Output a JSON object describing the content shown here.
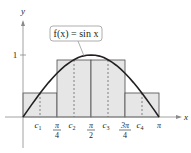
{
  "diagram": {
    "type": "midpoint-riemann-sum",
    "function_label": "f(x) = sin x",
    "axis": {
      "x_label": "x",
      "y_label": "y",
      "y_tick_label": "1"
    },
    "x_ticks": [
      {
        "num": "π",
        "den": "4"
      },
      {
        "num": "π",
        "den": "2"
      },
      {
        "num": "3π",
        "den": "4"
      },
      {
        "num": "π",
        "den": ""
      }
    ],
    "midpoints": [
      "c",
      "c",
      "c",
      "c"
    ],
    "midpoint_subscripts": [
      "1",
      "2",
      "3",
      "4"
    ],
    "rectangles": [
      {
        "x_start": 0,
        "x_end": 0.7854,
        "height": 0.383
      },
      {
        "x_start": 0.7854,
        "x_end": 1.5708,
        "height": 0.924
      },
      {
        "x_start": 1.5708,
        "x_end": 2.3562,
        "height": 0.924
      },
      {
        "x_start": 2.3562,
        "x_end": 3.1416,
        "height": 0.383
      }
    ],
    "colors": {
      "fill": "#e6e6e6",
      "stroke": "#231f20",
      "axis": "#8a8a8a",
      "label_box": "#9a9a9a"
    }
  }
}
